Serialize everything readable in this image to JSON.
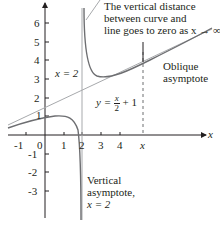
{
  "diagram": {
    "function": "y = (x^2 - 3)/(2x - 4)",
    "axes": {
      "x_label": "x",
      "y_label": "y",
      "x_ticks": [
        "-1",
        "0",
        "1",
        "2",
        "3",
        "4",
        "x"
      ],
      "y_ticks": [
        "6",
        "5",
        "4",
        "3",
        "2",
        "1",
        "-1",
        "-2",
        "-3"
      ]
    },
    "annotations": {
      "top_note_line1": "The vertical distance",
      "top_note_line2": "between curve and",
      "top_note_line3": "line goes to zero as x → ∞",
      "oblique_line1": "Oblique",
      "oblique_line2": "asymptote",
      "line_eq_lhs": "y =",
      "line_eq_num": "x",
      "line_eq_den": "2",
      "line_eq_rhs": "+ 1",
      "vertical_asym_label": "x = 2",
      "vertical_note_line1": "Vertical",
      "vertical_note_line2": "asymptote,",
      "vertical_note_line3": "x = 2"
    },
    "colors": {
      "curve": "#6d6e71",
      "asymptote": "#a7a9ac",
      "axes": "#231f20"
    }
  }
}
